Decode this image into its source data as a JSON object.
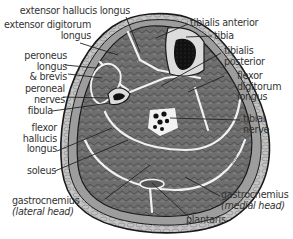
{
  "colors": {
    "background": "#ffffff",
    "skin": "#c9c9c9",
    "outline": "#1a1a1a",
    "muscle": "#6e6e6e",
    "fascia": "#f2f2f2",
    "bone_cortex": "#dcdcdc",
    "bone_marrow": "#111111",
    "label_text": "#333333"
  },
  "labels": {
    "extensor_hallucis_longus": "extensor hallucis longus",
    "extensor_digitorum_line1": "extensor digitorum",
    "extensor_digitorum_line2": "longus",
    "peroneus_line1": "peroneus",
    "peroneus_line2": "longus",
    "peroneus_line3": "& brevis",
    "peroneal_line1": "peroneal",
    "peroneal_line2": "nerves",
    "fibula": "fibula",
    "fhl_line1": "flexor",
    "fhl_line2": "hallucis",
    "fhl_line3": "longus",
    "soleus": "soleus",
    "gastroc_lateral_line1": "gastrocnemius",
    "gastroc_lateral_line2": "(lateral head)",
    "tibialis_anterior": "tibialis anterior",
    "tibia": "tibia",
    "tibialis_posterior_line1": "tibialis",
    "tibialis_posterior_line2": "posterior",
    "fdl_line1": "flexor",
    "fdl_line2": "digitorum",
    "fdl_line3": "longus",
    "tibial_nerve_line1": "tibial",
    "tibial_nerve_line2": "nerve",
    "gastroc_medial_line1": "gastrocnemius",
    "gastroc_medial_line2": "(medial head)",
    "plantaris": "plantaris"
  }
}
